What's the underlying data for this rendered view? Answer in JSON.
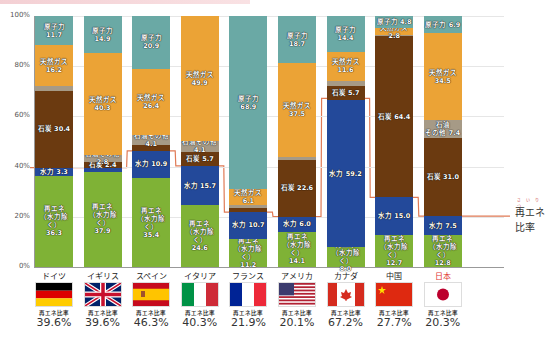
{
  "title_caption": "",
  "chart_data": {
    "type": "bar",
    "stacked": true,
    "xlabel": "",
    "ylabel": "",
    "ylim": [
      0,
      100
    ],
    "yticks": [
      "0%",
      "20%",
      "40%",
      "60%",
      "80%",
      "100%"
    ],
    "grid": true,
    "categories": [
      "ドイツ",
      "イギリス",
      "スペイン",
      "イタリア",
      "フランス",
      "アメリカ",
      "カナダ",
      "中国",
      "日本"
    ],
    "series": [
      {
        "name": "再エネ（水力除く）",
        "color": "#7fb236",
        "values": [
          36.3,
          37.9,
          35.4,
          24.6,
          11.2,
          14.1,
          8.0,
          12.7,
          12.8
        ]
      },
      {
        "name": "水力",
        "color": "#23499a",
        "values": [
          3.3,
          1.6,
          10.9,
          15.7,
          10.7,
          6.0,
          59.2,
          15.0,
          7.5
        ]
      },
      {
        "name": "石炭",
        "color": "#6b3a10",
        "values": [
          30.4,
          2.4,
          2.2,
          5.7,
          1.4,
          22.6,
          5.7,
          64.4,
          31.0
        ]
      },
      {
        "name": "石油その他",
        "color": "#a69a86",
        "values": [
          2.1,
          2.8,
          4.1,
          4.1,
          1.5,
          1.1,
          2.3,
          0.3,
          7.4
        ]
      },
      {
        "name": "天然ガス",
        "color": "#eba336",
        "values": [
          16.2,
          40.3,
          26.4,
          49.9,
          6.1,
          37.5,
          11.6,
          2.8,
          34.5
        ]
      },
      {
        "name": "原子力",
        "color": "#6aa9a5",
        "values": [
          11.7,
          14.9,
          20.9,
          0.0,
          68.9,
          18.7,
          14.4,
          4.8,
          6.9
        ]
      }
    ],
    "renewable_ratio": {
      "label": "再エネ比率",
      "values": [
        39.6,
        39.6,
        46.3,
        40.3,
        21.9,
        20.1,
        67.2,
        27.7,
        20.3
      ],
      "color": "#e07a55"
    }
  },
  "labels": {
    "segments": [
      [
        "再エネ\n（水力除く）\n36.3",
        "水力 3.3",
        "石炭 30.4",
        "石油その他 2.1",
        "天然ガス\n16.2",
        "原子力 11.7"
      ],
      [
        "再エネ\n（水力除く）\n37.9",
        "水力 1.6",
        "石炭 2.4",
        "石油その他 2.8",
        "天然ガス\n40.3",
        "原子力 14.9"
      ],
      [
        "再エネ\n（水力除く）\n35.4",
        "水力 10.9",
        "石炭 2.2",
        "石油その他 4.1",
        "天然ガス\n26.4",
        "原子力 20.9"
      ],
      [
        "再エネ\n（水力除く）\n24.6",
        "水力 15.7",
        "石炭 5.7",
        "石油その他 4.1",
        "天然ガス\n49.9",
        "原子力 0.0"
      ],
      [
        "再エネ\n（水力除く）\n11.2",
        "水力 10.7",
        "石炭 1.4",
        "石油その他 1.5",
        "天然ガス 6.1",
        "原子力 68.9"
      ],
      [
        "再エネ\n（水力除く）\n14.1",
        "水力 6.0",
        "石炭 22.6",
        "石油その他 1.1",
        "天然ガス\n37.5",
        "原子力 18.7"
      ],
      [
        "再エネ\n（水力除く）\n8.0",
        "水力 59.2",
        "石炭 5.7",
        "石油その他 2.3",
        "天然ガス\n11.6",
        "原子力 14.4"
      ],
      [
        "再エネ\n（水力除く）\n12.7",
        "水力 15.0",
        "石炭 64.4",
        "石油その他 0.3",
        "天然ガス 2.8",
        "原子力 4.8"
      ],
      [
        "再エネ\n（水力除く）\n12.8",
        "水力 7.5",
        "石炭 31.0",
        "石油\nその他 7.4",
        "天然ガス\n34.5",
        "原子力 6.9"
      ]
    ]
  },
  "countries": [
    {
      "name": "ドイツ",
      "ratio": "39.6%",
      "flag": "germany"
    },
    {
      "name": "イギリス",
      "ratio": "39.6%",
      "flag": "uk"
    },
    {
      "name": "スペイン",
      "ratio": "46.3%",
      "flag": "spain"
    },
    {
      "name": "イタリア",
      "ratio": "40.3%",
      "flag": "italy"
    },
    {
      "name": "フランス",
      "ratio": "21.9%",
      "flag": "france"
    },
    {
      "name": "アメリカ",
      "ratio": "20.1%",
      "flag": "usa"
    },
    {
      "name": "カナダ",
      "ratio": "67.2%",
      "flag": "canada"
    },
    {
      "name": "中国",
      "ratio": "27.7%",
      "flag": "china"
    },
    {
      "name": "日本",
      "ratio": "20.3%",
      "flag": "japan",
      "highlight": "#e0342f"
    }
  ],
  "ratio_caption": "再エネ比率",
  "legend": {
    "line_label": "再エネ比率",
    "ruby": "さいりつ"
  }
}
